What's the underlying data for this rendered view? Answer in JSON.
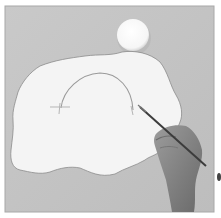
{
  "image": {
    "description": "Grayscale photograph of a hand holding a paintbrush, drawing an arc on a white irregular cut-paper shape placed on a gray board, with a white round disc at the top",
    "elements": [
      {
        "name": "gray-board",
        "color": "#c4c4c4"
      },
      {
        "name": "white-disc",
        "color": "#fbfbfb"
      },
      {
        "name": "paper-shape",
        "color": "#f3f3f3"
      },
      {
        "name": "drawn-arc",
        "color": "#9a9a9a"
      },
      {
        "name": "hand",
        "color": "#8a8a8a"
      },
      {
        "name": "paintbrush",
        "color": "#3c3c3c"
      }
    ]
  }
}
